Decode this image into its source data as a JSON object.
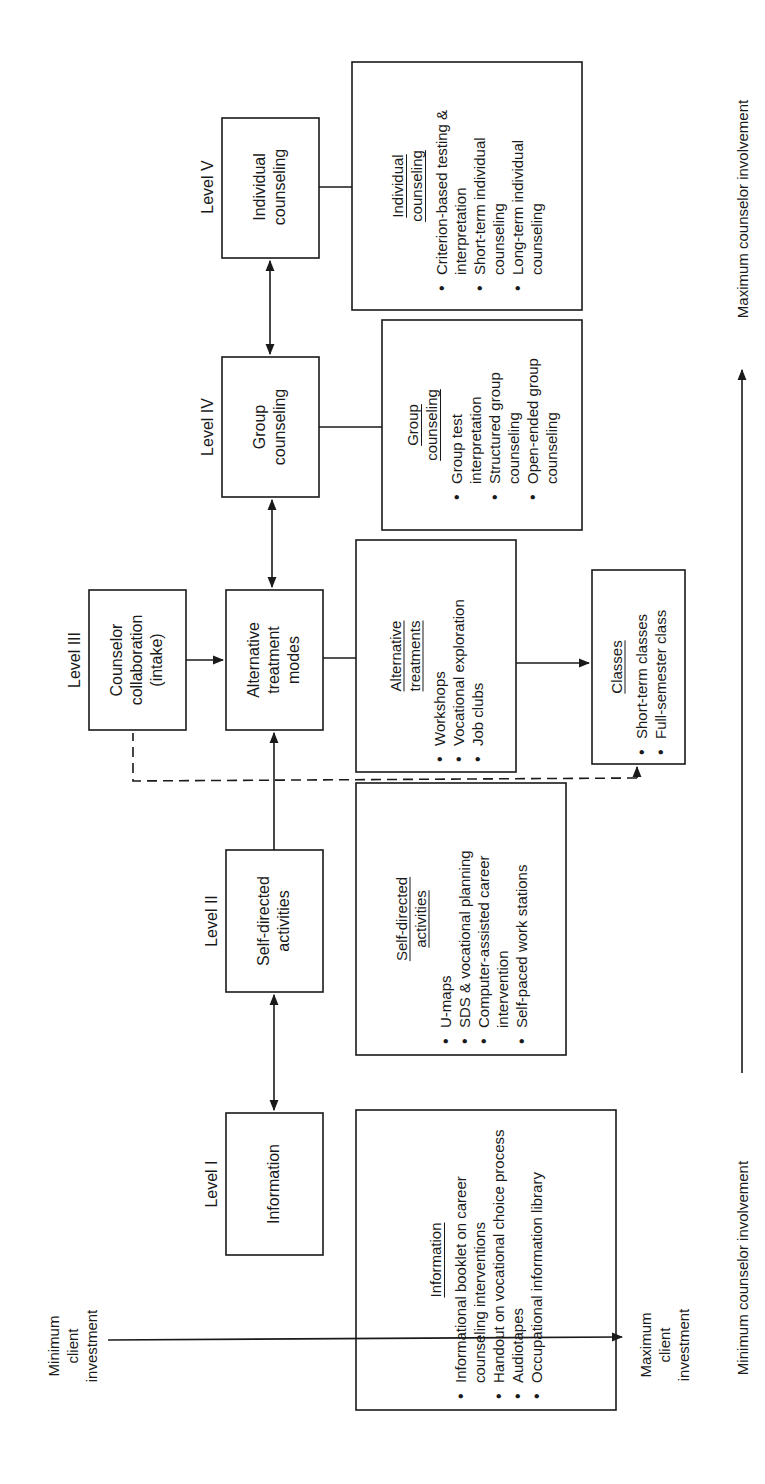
{
  "levels": [
    {
      "label": "Level I",
      "node": "Information"
    },
    {
      "label": "Level II",
      "node": "Self-directed\nactivities"
    },
    {
      "label": "Level III",
      "node": "Counselor\ncollaboration\n(intake)"
    },
    {
      "label": "",
      "node": "Alternative\ntreatment\nmodes"
    },
    {
      "label": "Level IV",
      "node": "Group\ncounseling"
    },
    {
      "label": "Level V",
      "node": "Individual\ncounseling"
    }
  ],
  "details": {
    "information": {
      "title": "Information",
      "items": [
        "Informational booklet on career counseling interventions",
        "Handout on vocational choice process",
        "Audiotapes",
        "Occupational information library"
      ]
    },
    "self_directed": {
      "title": "Self-directed activities",
      "items": [
        "U-maps",
        "SDS & vocational planning",
        "Computer-assisted career intervention",
        "Self-paced work stations"
      ]
    },
    "alternative": {
      "title": "Alternative treatments",
      "items": [
        "Workshops",
        "Vocational exploration",
        "Job clubs"
      ]
    },
    "classes": {
      "title": "Classes",
      "items": [
        "Short-term classes",
        "Full-semester class"
      ]
    },
    "group": {
      "title": "Group counseling",
      "items": [
        "Group test interpretation",
        "Structured group counseling",
        "Open-ended group counseling"
      ]
    },
    "individual": {
      "title": "Individual counseling",
      "items": [
        "Criterion-based testing & interpretation",
        "Short-term individual counseling",
        "Long-term individual counseling"
      ]
    }
  },
  "axes": {
    "client_min": "Minimum\nclient\ninvestment",
    "client_max": "Maximum\nclient\ninvestment",
    "counselor_min": "Minimum counselor involvement",
    "counselor_max": "Maximum counselor involvement"
  },
  "colors": {
    "ink": "#1a1a1a",
    "background": "#ffffff"
  }
}
